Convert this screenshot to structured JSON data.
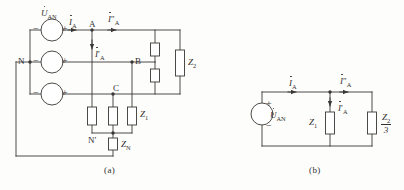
{
  "figure": {
    "captions": [
      {
        "id": "caption-a",
        "text": "(a)"
      },
      {
        "id": "caption-b",
        "text": "(b)"
      }
    ]
  },
  "colors": {
    "wire": "#3a3836",
    "text": "#33312f",
    "background": "#fdfdfc",
    "component_fill": "#ffffff"
  },
  "circuit_a": {
    "name": "full-three-phase-circuit",
    "sources": [
      {
        "id": "source-phase-a",
        "label": "U",
        "label_sub": "AN",
        "dotted": true,
        "minus": "−",
        "plus": "+"
      },
      {
        "id": "source-phase-b",
        "label": "",
        "label_sub": "",
        "dotted": false,
        "minus": "−",
        "plus": "+"
      },
      {
        "id": "source-phase-c",
        "label": "",
        "label_sub": "",
        "dotted": false,
        "minus": "−",
        "plus": "+"
      }
    ],
    "nodes": [
      {
        "id": "node-n",
        "text": "N"
      },
      {
        "id": "node-a",
        "text": "A"
      },
      {
        "id": "node-b",
        "text": "B"
      },
      {
        "id": "node-c",
        "text": "C"
      },
      {
        "id": "node-n-prime",
        "text": "N′"
      }
    ],
    "currents": [
      {
        "id": "current-ia",
        "symbol": "I",
        "primes": "",
        "sub": "A"
      },
      {
        "id": "current-ia-double-prime",
        "symbol": "I",
        "primes": "″",
        "sub": "A"
      },
      {
        "id": "current-ia-prime",
        "symbol": "I",
        "primes": "′",
        "sub": "A"
      }
    ],
    "impedances": [
      {
        "id": "impedance-z2",
        "symbol": "Z",
        "sub": "2"
      },
      {
        "id": "impedance-z1",
        "symbol": "Z",
        "sub": "1"
      },
      {
        "id": "impedance-zn",
        "symbol": "Z",
        "sub": "N"
      }
    ]
  },
  "circuit_b": {
    "name": "single-phase-equivalent-circuit",
    "source": {
      "id": "source-uan",
      "label": "U",
      "label_sub": "AN",
      "dotted": true,
      "plus": "+",
      "minus": "−"
    },
    "currents": [
      {
        "id": "current-ia-b",
        "symbol": "I",
        "primes": "",
        "sub": "A"
      },
      {
        "id": "current-ia-double-prime-b",
        "symbol": "I",
        "primes": "″",
        "sub": "A"
      },
      {
        "id": "current-ia-prime-b",
        "symbol": "I",
        "primes": "′",
        "sub": "A"
      }
    ],
    "impedances": [
      {
        "id": "impedance-z1-b",
        "symbol": "Z",
        "sub": "1"
      },
      {
        "id": "impedance-z2-over-3",
        "numerator": "Z",
        "numerator_sub": "2",
        "denominator": "3"
      }
    ]
  }
}
